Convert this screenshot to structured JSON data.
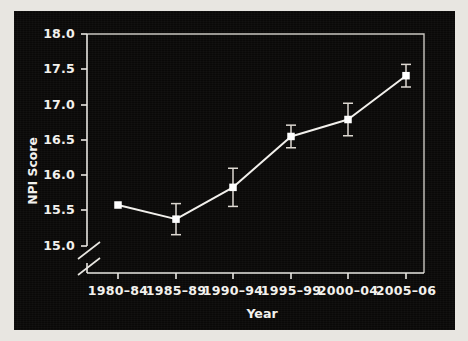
{
  "figure": {
    "background_color": "#0a0908",
    "foreground_color": "#f3f1ed",
    "page_color": "#e8e6e1",
    "axis_break_note": "y-axis break below 15.0"
  },
  "chart_data": {
    "type": "line",
    "title": "",
    "xlabel": "Year",
    "ylabel": "NPI Score",
    "categories": [
      "1980–84",
      "1985–89",
      "1990–94",
      "1995–99",
      "2000–04",
      "2005–06"
    ],
    "values": [
      15.58,
      15.38,
      15.83,
      16.55,
      16.79,
      17.41
    ],
    "error_upper": [
      0.0,
      0.22,
      0.27,
      0.16,
      0.23,
      0.16
    ],
    "error_lower": [
      0.0,
      0.22,
      0.27,
      0.16,
      0.23,
      0.16
    ],
    "ylim": [
      14.75,
      18.0
    ],
    "yticks": [
      15.0,
      15.5,
      16.0,
      16.5,
      17.0,
      17.5,
      18.0
    ],
    "ytick_labels": [
      "15.0",
      "15.5",
      "16.0",
      "16.5",
      "17.0",
      "17.5",
      "18.0"
    ],
    "grid": false,
    "legend": "none",
    "marker": "square",
    "line_color": "#f2f0ec",
    "marker_color": "#ffffff",
    "errorbar_color": "#ded9d2"
  },
  "axes": {
    "y_title": "NPI Score",
    "x_title": "Year",
    "y_tick_labels": [
      "18.0",
      "17.5",
      "17.0",
      "16.5",
      "16.0",
      "15.5",
      "15.0"
    ],
    "x_tick_labels": [
      "1980–84",
      "1985–89",
      "1990–94",
      "1995–99",
      "2000–04",
      "2005–06"
    ]
  }
}
